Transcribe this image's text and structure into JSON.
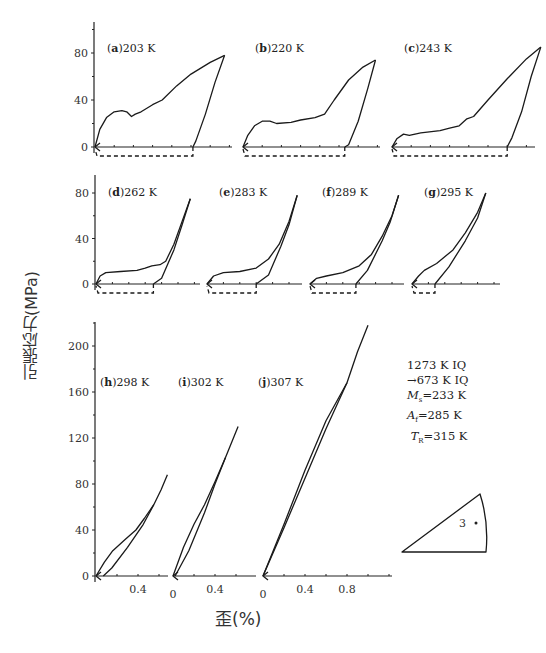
{
  "figure": {
    "ylabel": "引張応力(MPa)",
    "xlabel": "歪(%)",
    "notes": [
      "1273 K IQ",
      "→673 K IQ",
      "Ms=233 K",
      "Af=285 K",
      "TR=315 K"
    ],
    "inset_label": "3"
  },
  "chart_data": [
    {
      "type": "line",
      "title": "Tensile stress-strain loading/unloading curves at various temperatures",
      "xlabel": "歪(%)",
      "ylabel": "引張応力(MPa)",
      "rows": [
        {
          "row": "top",
          "yticks": [
            0,
            40,
            80
          ],
          "ylim": [
            0,
            100
          ],
          "panels": [
            {
              "id": "a",
              "label": "(a)203 K",
              "temperature_K": 203,
              "loading": [
                [
                  0,
                  0
                ],
                [
                  0.05,
                  15
                ],
                [
                  0.12,
                  25
                ],
                [
                  0.2,
                  30
                ],
                [
                  0.28,
                  31
                ],
                [
                  0.33,
                  30
                ],
                [
                  0.38,
                  26
                ],
                [
                  0.42,
                  28
                ],
                [
                  0.48,
                  30
                ],
                [
                  0.6,
                  36
                ],
                [
                  0.7,
                  40
                ],
                [
                  0.85,
                  52
                ],
                [
                  1.0,
                  62
                ],
                [
                  1.2,
                  72
                ],
                [
                  1.35,
                  78
                ]
              ],
              "unloading": [
                [
                  1.35,
                  78
                ],
                [
                  1.25,
                  55
                ],
                [
                  1.15,
                  28
                ],
                [
                  1.05,
                  5
                ],
                [
                  1.02,
                  0
                ]
              ],
              "residual_strain_pct": 1.02
            },
            {
              "id": "b",
              "label": "(b)220 K",
              "temperature_K": 220,
              "loading": [
                [
                  0,
                  0
                ],
                [
                  0.05,
                  10
                ],
                [
                  0.12,
                  18
                ],
                [
                  0.2,
                  22
                ],
                [
                  0.28,
                  22
                ],
                [
                  0.35,
                  20
                ],
                [
                  0.5,
                  21
                ],
                [
                  0.6,
                  23
                ],
                [
                  0.75,
                  25
                ],
                [
                  0.85,
                  28
                ],
                [
                  0.95,
                  40
                ],
                [
                  1.1,
                  57
                ],
                [
                  1.25,
                  68
                ],
                [
                  1.38,
                  74
                ]
              ],
              "unloading": [
                [
                  1.38,
                  74
                ],
                [
                  1.3,
                  50
                ],
                [
                  1.2,
                  22
                ],
                [
                  1.1,
                  2
                ],
                [
                  1.06,
                  0
                ]
              ],
              "residual_strain_pct": 1.06
            },
            {
              "id": "c",
              "label": "(c)243 K",
              "temperature_K": 243,
              "loading": [
                [
                  0,
                  0
                ],
                [
                  0.05,
                  7
                ],
                [
                  0.12,
                  11
                ],
                [
                  0.18,
                  10
                ],
                [
                  0.3,
                  12
                ],
                [
                  0.5,
                  14
                ],
                [
                  0.6,
                  16
                ],
                [
                  0.7,
                  18
                ],
                [
                  0.78,
                  24
                ],
                [
                  0.85,
                  26
                ],
                [
                  1.0,
                  40
                ],
                [
                  1.2,
                  58
                ],
                [
                  1.4,
                  75
                ],
                [
                  1.55,
                  85
                ]
              ],
              "unloading": [
                [
                  1.55,
                  85
                ],
                [
                  1.45,
                  60
                ],
                [
                  1.35,
                  30
                ],
                [
                  1.25,
                  8
                ],
                [
                  1.2,
                  0
                ]
              ],
              "residual_strain_pct": 1.2
            }
          ]
        },
        {
          "row": "middle",
          "yticks": [
            0,
            40,
            80
          ],
          "ylim": [
            0,
            95
          ],
          "panels": [
            {
              "id": "d",
              "label": "(d)262 K",
              "temperature_K": 262,
              "loading": [
                [
                  0,
                  0
                ],
                [
                  0.05,
                  7
                ],
                [
                  0.12,
                  10
                ],
                [
                  0.3,
                  11
                ],
                [
                  0.5,
                  12
                ],
                [
                  0.6,
                  14
                ],
                [
                  0.68,
                  16
                ],
                [
                  0.78,
                  17
                ],
                [
                  0.85,
                  20
                ],
                [
                  0.95,
                  35
                ],
                [
                  1.05,
                  55
                ],
                [
                  1.15,
                  75
                ]
              ],
              "unloading": [
                [
                  1.15,
                  75
                ],
                [
                  1.05,
                  52
                ],
                [
                  0.95,
                  30
                ],
                [
                  0.8,
                  5
                ],
                [
                  0.7,
                  0
                ]
              ],
              "residual_strain_pct": 0.7
            },
            {
              "id": "e",
              "label": "(e)283 K",
              "temperature_K": 283,
              "loading": [
                [
                  0,
                  0
                ],
                [
                  0.08,
                  7
                ],
                [
                  0.2,
                  10
                ],
                [
                  0.4,
                  11
                ],
                [
                  0.6,
                  14
                ],
                [
                  0.75,
                  22
                ],
                [
                  0.88,
                  35
                ],
                [
                  1.0,
                  55
                ],
                [
                  1.1,
                  78
                ]
              ],
              "unloading": [
                [
                  1.1,
                  78
                ],
                [
                  1.0,
                  52
                ],
                [
                  0.9,
                  33
                ],
                [
                  0.75,
                  8
                ],
                [
                  0.6,
                  0
                ]
              ],
              "residual_strain_pct": 0.6
            },
            {
              "id": "f",
              "label": "(f)289 K",
              "temperature_K": 289,
              "loading": [
                [
                  0,
                  0
                ],
                [
                  0.08,
                  5
                ],
                [
                  0.2,
                  7
                ],
                [
                  0.4,
                  10
                ],
                [
                  0.6,
                  16
                ],
                [
                  0.75,
                  26
                ],
                [
                  0.88,
                  42
                ],
                [
                  1.0,
                  60
                ],
                [
                  1.08,
                  78
                ]
              ],
              "unloading": [
                [
                  1.08,
                  78
                ],
                [
                  0.98,
                  55
                ],
                [
                  0.88,
                  38
                ],
                [
                  0.7,
                  12
                ],
                [
                  0.56,
                  0
                ]
              ],
              "residual_strain_pct": 0.56
            },
            {
              "id": "g",
              "label": "(g)295 K",
              "temperature_K": 295,
              "loading": [
                [
                  0,
                  0
                ],
                [
                  0.08,
                  7
                ],
                [
                  0.15,
                  12
                ],
                [
                  0.3,
                  18
                ],
                [
                  0.5,
                  30
                ],
                [
                  0.65,
                  45
                ],
                [
                  0.8,
                  63
                ],
                [
                  0.9,
                  80
                ]
              ],
              "unloading": [
                [
                  0.9,
                  80
                ],
                [
                  0.8,
                  58
                ],
                [
                  0.65,
                  38
                ],
                [
                  0.45,
                  15
                ],
                [
                  0.28,
                  0
                ]
              ],
              "residual_strain_pct": 0.28
            }
          ]
        },
        {
          "row": "bottom",
          "yticks": [
            0,
            40,
            80,
            120,
            160,
            200
          ],
          "ylim": [
            0,
            225
          ],
          "panels": [
            {
              "id": "h",
              "label": "(h)298 K",
              "temperature_K": 298,
              "xticks": [
                0.4
              ],
              "loading": [
                [
                  0,
                  0
                ],
                [
                  0.08,
                  12
                ],
                [
                  0.16,
                  22
                ],
                [
                  0.28,
                  32
                ],
                [
                  0.38,
                  40
                ],
                [
                  0.46,
                  50
                ],
                [
                  0.55,
                  62
                ],
                [
                  0.62,
                  75
                ],
                [
                  0.68,
                  88
                ]
              ],
              "unloading": [
                [
                  0.55,
                  62
                ],
                [
                  0.45,
                  45
                ],
                [
                  0.3,
                  25
                ],
                [
                  0.15,
                  7
                ],
                [
                  0.07,
                  0
                ]
              ],
              "residual_strain_pct": 0.07
            },
            {
              "id": "i",
              "label": "(i)302 K",
              "temperature_K": 302,
              "xticks": [
                0,
                0.4
              ],
              "loading": [
                [
                  0,
                  0
                ],
                [
                  0.1,
                  25
                ],
                [
                  0.2,
                  45
                ],
                [
                  0.3,
                  62
                ],
                [
                  0.4,
                  82
                ],
                [
                  0.5,
                  103
                ],
                [
                  0.62,
                  130
                ]
              ],
              "unloading": [
                [
                  0.5,
                  103
                ],
                [
                  0.4,
                  80
                ],
                [
                  0.3,
                  55
                ],
                [
                  0.15,
                  22
                ],
                [
                  0.02,
                  0
                ]
              ],
              "residual_strain_pct": 0.02
            },
            {
              "id": "j",
              "label": "(j)307 K",
              "temperature_K": 307,
              "xticks": [
                0,
                0.4,
                0.8
              ],
              "loading": [
                [
                  0,
                  0
                ],
                [
                  0.2,
                  45
                ],
                [
                  0.4,
                  92
                ],
                [
                  0.6,
                  135
                ],
                [
                  0.8,
                  168
                ],
                [
                  0.9,
                  195
                ],
                [
                  1.0,
                  218
                ]
              ],
              "unloading": [
                [
                  0.8,
                  168
                ],
                [
                  0.6,
                  128
                ],
                [
                  0.4,
                  85
                ],
                [
                  0.2,
                  42
                ],
                [
                  0,
                  0
                ]
              ],
              "residual_strain_pct": 0.0
            }
          ]
        }
      ],
      "legend_notes": [
        "1273 K IQ",
        "→673 K IQ",
        "Ms=233 K",
        "Af=285 K",
        "TR=315 K"
      ],
      "grid": false
    }
  ]
}
